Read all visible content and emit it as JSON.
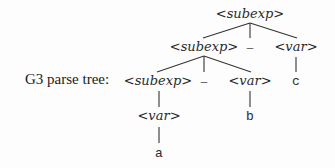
{
  "diagram": {
    "label": "G3 parse tree:",
    "nodes": {
      "root": "<subexp>",
      "l2_subexp": "<subexp>",
      "l2_op": "–",
      "l2_var": "<var>",
      "l3_subexp": "<subexp>",
      "l3_op": "–",
      "l3_var": "<var>",
      "l3_c": "c",
      "l4_var": "<var>",
      "l4_b": "b",
      "l5_a": "a"
    },
    "colors": {
      "text": "#2a2a2a",
      "edge": "#333333",
      "background": "#fdfdfd"
    }
  }
}
